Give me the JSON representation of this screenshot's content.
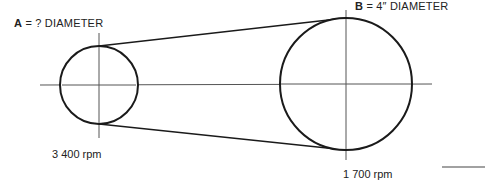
{
  "diagram": {
    "pulley_a": {
      "letter": "A",
      "label_rest": " = ? DIAMETER",
      "speed": "3 400 rpm",
      "center": [
        99,
        85
      ],
      "radius": 39
    },
    "pulley_b": {
      "letter": "B",
      "label_rest": " = 4″ DIAMETER",
      "speed": "1 700 rpm",
      "center": [
        346,
        84
      ],
      "radius": 66
    },
    "colors": {
      "line": "#1a1a1a",
      "centerline": "#555555"
    }
  }
}
